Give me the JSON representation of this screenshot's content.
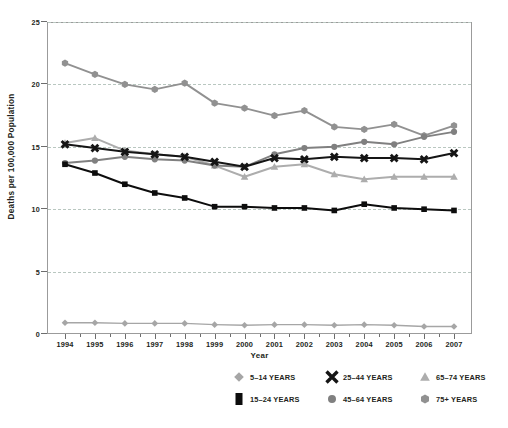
{
  "chart_data": {
    "type": "line",
    "title": "",
    "xlabel": "Year",
    "ylabel": "Deaths per 100,000 Population",
    "categories": [
      1994,
      1995,
      1996,
      1997,
      1998,
      1999,
      2000,
      2001,
      2002,
      2003,
      2004,
      2005,
      2006,
      2007
    ],
    "x": [
      "1994",
      "1995",
      "1996",
      "1997",
      "1998",
      "1999",
      "2000",
      "2001",
      "2002",
      "2003",
      "2004",
      "2005",
      "2006",
      "2007"
    ],
    "xlim": [
      1994,
      2007
    ],
    "ylim": [
      0,
      25
    ],
    "yticks": [
      0,
      5,
      10,
      15,
      20,
      25
    ],
    "ytick_labels": [
      "0",
      "5",
      "10",
      "15",
      "20",
      "25"
    ],
    "grid": true,
    "legend_position": "bottom",
    "series": [
      {
        "name": "5–14 YEARS",
        "marker": "diamond",
        "color": "#a6a6a6",
        "line_color": "#a6a6a6",
        "values": [
          0.9,
          0.9,
          0.85,
          0.85,
          0.85,
          0.75,
          0.7,
          0.75,
          0.75,
          0.7,
          0.75,
          0.7,
          0.6,
          0.6
        ]
      },
      {
        "name": "15–24 YEARS",
        "marker": "square",
        "color": "#0d0d0d",
        "line_color": "#0d0d0d",
        "values": [
          13.6,
          12.9,
          12.0,
          11.3,
          10.9,
          10.2,
          10.2,
          10.1,
          10.1,
          9.9,
          10.4,
          10.1,
          10.0,
          9.9
        ]
      },
      {
        "name": "25–44 YEARS",
        "marker": "x",
        "color": "#151515",
        "line_color": "#151515",
        "values": [
          15.2,
          14.9,
          14.6,
          14.4,
          14.2,
          13.8,
          13.4,
          14.1,
          14.0,
          14.2,
          14.1,
          14.1,
          14.0,
          14.5
        ]
      },
      {
        "name": "45–64 YEARS",
        "marker": "circle",
        "color": "#808080",
        "line_color": "#808080",
        "values": [
          13.7,
          13.9,
          14.2,
          14.0,
          13.9,
          13.5,
          13.4,
          14.4,
          14.9,
          15.0,
          15.4,
          15.2,
          15.8,
          16.2
        ]
      },
      {
        "name": "65–74 YEARS",
        "marker": "triangle",
        "color": "#adadad",
        "line_color": "#adadad",
        "values": [
          15.3,
          15.7,
          14.7,
          14.4,
          14.2,
          13.5,
          12.6,
          13.4,
          13.6,
          12.8,
          12.4,
          12.6,
          12.6,
          12.6
        ]
      },
      {
        "name": "75+ YEARS",
        "marker": "hexagon",
        "color": "#919191",
        "line_color": "#919191",
        "values": [
          21.7,
          20.8,
          20.0,
          19.6,
          20.1,
          18.5,
          18.1,
          17.5,
          17.9,
          16.6,
          16.4,
          16.8,
          15.9,
          16.7
        ]
      }
    ]
  },
  "axes": {
    "x_title": "Year",
    "y_title": "Deaths per 100,000 Population",
    "y_tick_labels": [
      "25",
      "20",
      "15",
      "10",
      "5",
      "0"
    ],
    "x_tick_labels": [
      "1994",
      "1995",
      "1996",
      "1997",
      "1998",
      "1999",
      "2000",
      "2001",
      "2002",
      "2003",
      "2004",
      "2005",
      "2006",
      "2007"
    ]
  },
  "legend": {
    "rows": [
      [
        {
          "label": "5–14 YEARS",
          "marker": "diamond",
          "color": "#a6a6a6"
        },
        {
          "label": "25–44 YEARS",
          "marker": "x",
          "color": "#151515"
        },
        {
          "label": "65–74 YEARS",
          "marker": "triangle",
          "color": "#adadad"
        }
      ],
      [
        {
          "label": "15–24 YEARS",
          "marker": "square",
          "color": "#0d0d0d"
        },
        {
          "label": "45–64 YEARS",
          "marker": "circle",
          "color": "#808080"
        },
        {
          "label": "75+ YEARS",
          "marker": "hexagon",
          "color": "#919191"
        }
      ]
    ]
  },
  "colors": {
    "background": "#ffffff",
    "frame": "#9b9b9b",
    "gridline": "#b9c7c0",
    "text": "#231f20"
  }
}
